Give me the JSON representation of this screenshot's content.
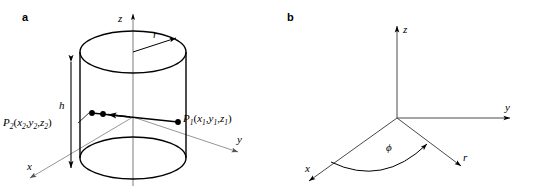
{
  "figure": {
    "width": 534,
    "height": 196,
    "background": "#ffffff",
    "stroke_dark": "#000000",
    "stroke_light": "#888888"
  },
  "panels": [
    {
      "id": "a",
      "label": "a",
      "caption_note": "Cylinder of radius r and height h in a 3D Cartesian coordinate system with two marked points P1 and P2 on its surface",
      "axes": [
        {
          "name": "z",
          "label": "z",
          "direction": "up"
        },
        {
          "name": "x",
          "label": "x",
          "direction": "down-left"
        },
        {
          "name": "y",
          "label": "y",
          "direction": "down-right"
        }
      ],
      "annotations": {
        "radius": "r",
        "height": "h",
        "point1": {
          "name": "P",
          "index": "1",
          "coords": [
            "x",
            "y",
            "z"
          ],
          "coord_index": "1",
          "text": "P1(x1,y1,z1)"
        },
        "point2": {
          "name": "P",
          "index": "2",
          "coords": [
            "x",
            "y",
            "z"
          ],
          "coord_index": "2",
          "text": "P2(x2,y2,z2)"
        }
      }
    },
    {
      "id": "b",
      "label": "b",
      "caption_note": "Cylindrical coordinate system showing the azimuthal angle phi measured from the x-axis to the radial direction r",
      "axes": [
        {
          "name": "z",
          "label": "z",
          "direction": "up"
        },
        {
          "name": "x",
          "label": "x",
          "direction": "down-left"
        },
        {
          "name": "y",
          "label": "y",
          "direction": "right"
        }
      ],
      "annotations": {
        "angle": "ϕ",
        "radial": "r"
      }
    }
  ]
}
